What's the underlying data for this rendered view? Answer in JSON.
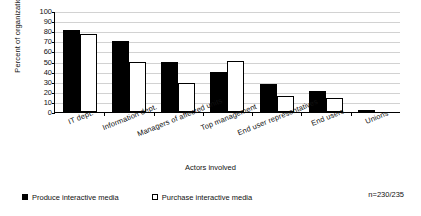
{
  "chart_data": {
    "type": "bar",
    "title": "",
    "xlabel": "Actors involved",
    "ylabel": "Percent of organizations",
    "ylim": [
      0,
      100
    ],
    "ytick_step": 10,
    "yticks": [
      "100",
      "90",
      "80",
      "70",
      "60",
      "50",
      "40",
      "30",
      "20",
      "10",
      "0"
    ],
    "grid": true,
    "legend_position": "bottom-left",
    "categories": [
      "IT dept.",
      "Information dept.",
      "Managers of affected units",
      "Top management",
      "End user representatives",
      "End users",
      "Unions"
    ],
    "series": [
      {
        "name": "Produce interactive media",
        "color": "#000000",
        "values": [
          81,
          70,
          50,
          40,
          28,
          21,
          1
        ]
      },
      {
        "name": "Purchase interactive media",
        "color": "#ffffff",
        "values": [
          77,
          50,
          29,
          51,
          16,
          14,
          0
        ]
      }
    ],
    "annotation": "n=230/235"
  },
  "legend": {
    "items": [
      {
        "label": "Produce interactive media",
        "marker": "filled-square"
      },
      {
        "label": "Purchase interactive media",
        "marker": "open-square"
      }
    ]
  }
}
